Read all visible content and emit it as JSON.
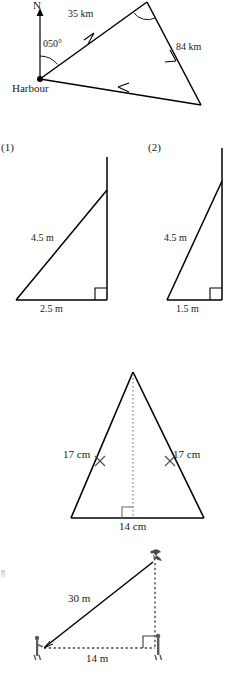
{
  "document": {
    "kind": "geometry-worksheet-figures",
    "page_background": "#ffffff",
    "ink_color": "#000000",
    "grey_ink_color": "#6b6b6b",
    "width": 236,
    "height": 674
  },
  "figures": [
    {
      "id": "bearing-triangle",
      "name": "Harbour bearing diagram",
      "type": "bearing-diagram",
      "labels": {
        "north": "N",
        "bearing": "050°",
        "start_point": "Harbour",
        "side_a": "35 km",
        "side_b": "84 km"
      },
      "vertices": {
        "harbour": [
          40,
          79
        ],
        "apex": [
          147,
          2
        ],
        "far": [
          201,
          105
        ]
      },
      "north_arrow": {
        "from": [
          40,
          79
        ],
        "to": [
          40,
          10
        ],
        "label_pos": [
          36,
          8
        ]
      },
      "arrow_markers": [
        {
          "on": "harbour-to-apex",
          "direction": "toward-apex"
        },
        {
          "on": "apex-to-far",
          "direction": "toward-far"
        },
        {
          "on": "far-to-harbour",
          "direction": "toward-harbour"
        }
      ],
      "angle_arcs": [
        {
          "at": "harbour",
          "label": "050°"
        },
        {
          "at": "apex",
          "label": ""
        }
      ]
    },
    {
      "id": "ladder-triangle-1",
      "name": "Ladder against wall (1)",
      "type": "right-triangle",
      "labels": {
        "number": "(1)",
        "hypotenuse": "4.5 m",
        "base": "2.5 m",
        "right_angle": "right-angle-marker"
      },
      "geometry": {
        "foot": [
          16,
          300
        ],
        "wall_base": [
          107,
          300
        ],
        "ladder_top": [
          107,
          190
        ],
        "wall_top": [
          107,
          157
        ]
      }
    },
    {
      "id": "ladder-triangle-2",
      "name": "Ladder against wall (2)",
      "type": "right-triangle",
      "labels": {
        "number": "(2)",
        "hypotenuse": "4.5 m",
        "base": "1.5 m",
        "right_angle": "right-angle-marker"
      },
      "geometry": {
        "foot": [
          167,
          300
        ],
        "wall_base": [
          222,
          300
        ],
        "ladder_top": [
          222,
          181
        ],
        "wall_top": [
          222,
          148
        ]
      }
    },
    {
      "id": "isosceles-triangle",
      "name": "Isosceles triangle with altitude",
      "type": "isosceles-triangle",
      "labels": {
        "left_side": "17 cm",
        "right_side": "17 cm",
        "base": "14 cm",
        "right_angle": "right-angle-marker",
        "tick_marks": "equal-side-tick"
      },
      "geometry": {
        "apex": [
          133,
          372
        ],
        "base_left": [
          71,
          518
        ],
        "base_right": [
          204,
          518
        ],
        "foot_of_altitude": [
          133,
          518
        ]
      }
    },
    {
      "id": "elevation-triangle",
      "name": "Angle of elevation to bird",
      "type": "right-triangle-elevation",
      "labels": {
        "hypotenuse": "30 m",
        "base": "14 m",
        "right_angle": "right-angle-marker"
      },
      "geometry": {
        "observer": [
          42,
          648
        ],
        "bird": [
          155,
          560
        ],
        "ground_point": [
          155,
          648
        ]
      },
      "icons": [
        {
          "name": "bird-icon",
          "at": [
            155,
            556
          ]
        },
        {
          "name": "person-observer-icon",
          "at": [
            38,
            648
          ]
        },
        {
          "name": "person-base-icon",
          "at": [
            158,
            646
          ]
        }
      ]
    }
  ],
  "stray_marks": [
    {
      "name": "page-edge-artifact",
      "at": [
        2,
        573
      ],
      "text": ""
    }
  ]
}
